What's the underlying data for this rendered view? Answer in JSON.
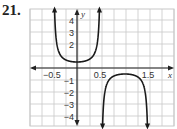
{
  "problem": {
    "number": "21."
  },
  "chart_data": {
    "type": "line",
    "title": "",
    "function_description": "y = 0.5 sec(pi x)",
    "xlabel": "x",
    "ylabel": "y",
    "xlim": [
      -0.625,
      2.0
    ],
    "ylim": [
      -4.8,
      4.9
    ],
    "grid": true,
    "grid_spacing": {
      "x": 0.25,
      "y": 1
    },
    "x_tick_labels": [
      {
        "value": -0.5,
        "label": "−0.5"
      },
      {
        "value": 0.5,
        "label": "0.5"
      },
      {
        "value": 1.5,
        "label": "1.5"
      }
    ],
    "y_tick_labels": [
      {
        "value": 4,
        "label": "4"
      },
      {
        "value": 3,
        "label": "3"
      },
      {
        "value": 2,
        "label": "2"
      },
      {
        "value": -1,
        "label": "−1"
      },
      {
        "value": -2,
        "label": "−2"
      },
      {
        "value": -3,
        "label": "−3"
      },
      {
        "value": -4,
        "label": "−4"
      }
    ],
    "vertical_asymptotes": [
      -0.5,
      0.5,
      1.5
    ],
    "series": [
      {
        "name": "upper branch",
        "x": [
          -0.45,
          -0.4,
          -0.3,
          -0.2,
          -0.1,
          0,
          0.1,
          0.2,
          0.3,
          0.4,
          0.45
        ],
        "y": [
          3.2,
          1.62,
          0.85,
          0.62,
          0.53,
          0.5,
          0.53,
          0.62,
          0.85,
          1.62,
          3.2
        ]
      },
      {
        "name": "lower branch",
        "x": [
          0.55,
          0.6,
          0.7,
          0.8,
          0.9,
          1.0,
          1.1,
          1.2,
          1.3,
          1.4,
          1.45
        ],
        "y": [
          -3.2,
          -1.62,
          -0.85,
          -0.62,
          -0.53,
          -0.5,
          -0.53,
          -0.62,
          -0.85,
          -1.62,
          -3.2
        ]
      }
    ]
  },
  "colors": {
    "curve": "#1a1a1a",
    "grid": "#c8c8c8",
    "axis": "#222222"
  }
}
